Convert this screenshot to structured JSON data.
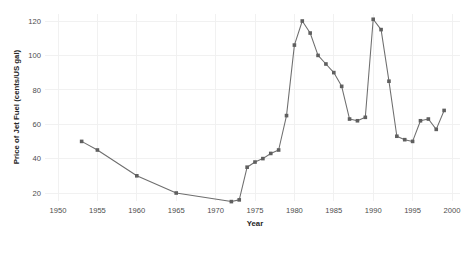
{
  "chart_data": {
    "type": "line",
    "title": "",
    "subtitle": "",
    "xlabel": "Year",
    "ylabel": "Price of Jet Fuel (cents/US gal)",
    "xlim": [
      1950,
      2000
    ],
    "ylim": [
      10,
      126
    ],
    "xticks": [
      1950,
      1955,
      1960,
      1965,
      1970,
      1975,
      1980,
      1985,
      1990,
      1995,
      2000
    ],
    "xtick_labels": [
      "1950",
      "1955",
      "1960",
      "1965",
      "1970",
      "1975",
      "1980",
      "1985",
      "1990",
      "1995",
      "2000"
    ],
    "yticks": [
      20,
      40,
      60,
      80,
      100,
      120
    ],
    "ytick_labels": [
      "20",
      "40",
      "60",
      "80",
      "100",
      "120"
    ],
    "grid": true,
    "legend": false,
    "legend_position": "none",
    "marker": "square",
    "line_color": "#6e6e6e",
    "marker_color": "#5f5f5f",
    "grid_color": "#f0f0f0",
    "background_color": "#ffffff",
    "x": [
      1953,
      1955,
      1960,
      1965,
      1972,
      1973,
      1974,
      1975,
      1976,
      1977,
      1978,
      1979,
      1980,
      1981,
      1982,
      1983,
      1984,
      1985,
      1986,
      1987,
      1988,
      1989,
      1990,
      1991,
      1992,
      1993,
      1994,
      1995,
      1996,
      1997,
      1998,
      1999
    ],
    "values": [
      50,
      45,
      30,
      20,
      15,
      16,
      35,
      38,
      40,
      43,
      45,
      65,
      106,
      120,
      113,
      100,
      95,
      90,
      82,
      63,
      62,
      64,
      121,
      115,
      85,
      53,
      51,
      50,
      62,
      63,
      57,
      68
    ],
    "series": [
      {
        "name": "Price of Jet Fuel",
        "x": [
          1953,
          1955,
          1960,
          1965,
          1972,
          1973,
          1974,
          1975,
          1976,
          1977,
          1978,
          1979,
          1980,
          1981,
          1982,
          1983,
          1984,
          1985,
          1986,
          1987,
          1988,
          1989,
          1990,
          1991,
          1992,
          1993,
          1994,
          1995,
          1996,
          1997,
          1998,
          1999
        ],
        "values": [
          50,
          45,
          30,
          20,
          15,
          16,
          35,
          38,
          40,
          43,
          45,
          65,
          106,
          120,
          113,
          100,
          95,
          90,
          82,
          63,
          62,
          64,
          121,
          115,
          85,
          53,
          51,
          50,
          62,
          63,
          57,
          68
        ]
      }
    ]
  }
}
